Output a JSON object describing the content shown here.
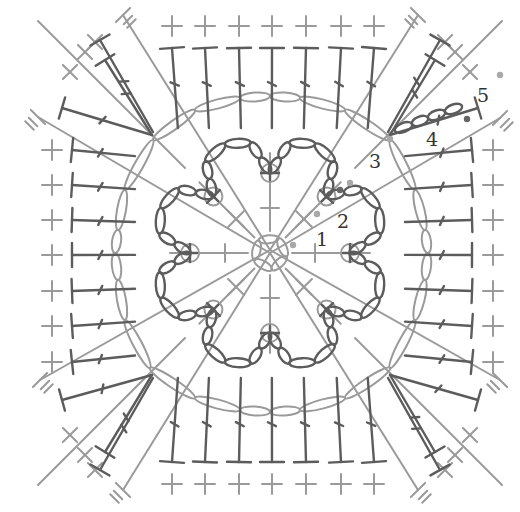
{
  "diagram": {
    "colors": {
      "background": "#ffffff",
      "light_stitch": "#9a9a9a",
      "dark_stitch": "#5c5c5c",
      "label": "#333333",
      "start_dot_light": "#a8a8a8",
      "start_dot_dark": "#666666"
    },
    "round_labels": [
      {
        "text": "1",
        "x": 322,
        "y": 246
      },
      {
        "text": "2",
        "x": 343,
        "y": 228
      },
      {
        "text": "3",
        "x": 375,
        "y": 168
      },
      {
        "text": "4",
        "x": 432,
        "y": 146
      },
      {
        "text": "5",
        "x": 483,
        "y": 102
      }
    ],
    "start_dots": [
      {
        "round": 1,
        "x": 293,
        "y": 245,
        "tone": "light"
      },
      {
        "round": 2,
        "x": 317,
        "y": 214,
        "tone": "light"
      },
      {
        "round": 2,
        "x": 340,
        "y": 190,
        "tone": "dark"
      },
      {
        "round": 3,
        "x": 350,
        "y": 183,
        "tone": "light"
      },
      {
        "round": 4,
        "x": 390,
        "y": 139,
        "tone": "light"
      },
      {
        "round": 4,
        "x": 467,
        "y": 119,
        "tone": "dark"
      },
      {
        "round": 5,
        "x": 500,
        "y": 75,
        "tone": "light"
      }
    ],
    "legend": {
      "stitch_types": [
        "chain (ch)",
        "single crochet (sc)",
        "double crochet (dc)",
        "slip stitch (sl st)"
      ]
    },
    "center": {
      "x": 270,
      "y": 253
    },
    "edge_positions": [
      172,
      205,
      239,
      272,
      306,
      341,
      374
    ],
    "side_positions": [
      150,
      185,
      220,
      255,
      291,
      326,
      362
    ]
  }
}
